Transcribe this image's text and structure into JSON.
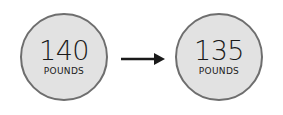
{
  "before": {
    "value": "140",
    "unit": "POUNDS"
  },
  "after": {
    "value": "135",
    "unit": "POUNDS"
  },
  "colors": {
    "circle_fill": "#e2e2e2",
    "circle_border": "#6e6e6e",
    "text": "#1a1a1a",
    "arrow": "#1a1a1a"
  }
}
